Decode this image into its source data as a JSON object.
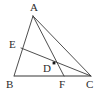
{
  "figure": {
    "background_color": "#ffffff",
    "width": 105,
    "height": 99,
    "line_color": "#3a3a3a",
    "base_line_color": "#9a9a9a",
    "label_color": "#2b2b2b",
    "point_marker_color": "#1a1a1a",
    "points": [
      {
        "name": "A",
        "label": "A",
        "x": 33,
        "y": 16,
        "label_x": 30,
        "label_y": 2,
        "marked": false
      },
      {
        "name": "B",
        "label": "B",
        "x": 14,
        "y": 76,
        "label_x": 6,
        "label_y": 79,
        "marked": false
      },
      {
        "name": "C",
        "label": "C",
        "x": 91,
        "y": 76,
        "label_x": 86,
        "label_y": 79,
        "marked": false
      },
      {
        "name": "D",
        "label": "D",
        "x": 54,
        "y": 63,
        "label_x": 43,
        "label_y": 63,
        "marked": true
      },
      {
        "name": "E",
        "label": "E",
        "x": 21,
        "y": 48,
        "label_x": 9,
        "label_y": 39,
        "marked": false
      },
      {
        "name": "F",
        "label": "F",
        "x": 64,
        "y": 76,
        "label_x": 59,
        "label_y": 79,
        "marked": false
      }
    ],
    "segments": [
      {
        "name": "segment-AB",
        "from": "A",
        "to": "B",
        "style": "thin"
      },
      {
        "name": "segment-AC",
        "from": "A",
        "to": "C",
        "style": "thin"
      },
      {
        "name": "segment-BC",
        "from": "B",
        "to": "C",
        "style": "thick-gray"
      },
      {
        "name": "segment-AF",
        "from": "A",
        "to": "F",
        "style": "thin"
      },
      {
        "name": "segment-EC",
        "from": "E",
        "to": "C",
        "style": "thin"
      }
    ]
  }
}
